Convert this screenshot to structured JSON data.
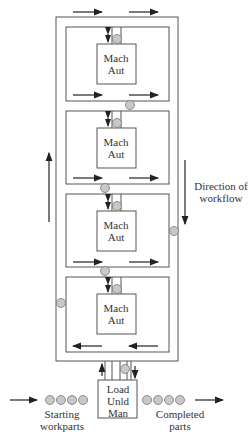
{
  "diagram": {
    "type": "flexible manufacturing system ladder layout",
    "stations": [
      {
        "label_line1": "Mach",
        "label_line2": "Aut"
      },
      {
        "label_line1": "Mach",
        "label_line2": "Aut"
      },
      {
        "label_line1": "Mach",
        "label_line2": "Aut"
      },
      {
        "label_line1": "Mach",
        "label_line2": "Aut"
      }
    ],
    "load_station": {
      "line1": "Load",
      "line2": "Unld",
      "line3": "Man"
    },
    "direction_label": {
      "line1": "Direction of",
      "line2": "workflow"
    },
    "starting_label": {
      "line1": "Starting",
      "line2": "workparts"
    },
    "completed_label": {
      "line1": "Completed",
      "line2": "parts"
    },
    "colors": {
      "line": "#555555",
      "part_fill": "#c8c8c8",
      "arrow": "#222222"
    }
  }
}
